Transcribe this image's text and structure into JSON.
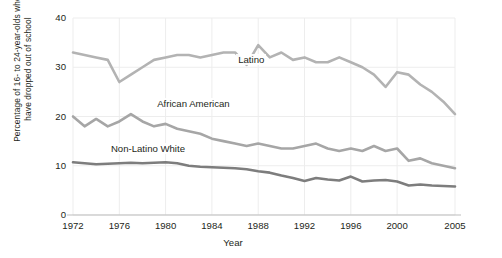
{
  "chart_data": {
    "type": "line",
    "title": "",
    "xlabel": "Year",
    "ylabel": "Percentage of 16- to 24-year-olds who have dropped out of school",
    "ylabel_lines": [
      "Percentage of 16- to 24-year-olds who",
      "have dropped out of school"
    ],
    "xlim": [
      1972,
      2005
    ],
    "ylim": [
      0,
      40
    ],
    "yticks": [
      0,
      10,
      20,
      30,
      40
    ],
    "ytick_labels": [
      "0",
      "10",
      "20",
      "30",
      "40"
    ],
    "xticks": [
      1972,
      1976,
      1980,
      1984,
      1988,
      1992,
      1996,
      2000,
      2005
    ],
    "xtick_labels": [
      "1972",
      "1976",
      "1980",
      "1984",
      "1988",
      "1992",
      "1996",
      "2000",
      "2005"
    ],
    "grid": "faint",
    "legend": "inline-labels",
    "x": [
      1972,
      1973,
      1974,
      1975,
      1976,
      1977,
      1978,
      1979,
      1980,
      1981,
      1982,
      1983,
      1984,
      1985,
      1986,
      1987,
      1988,
      1989,
      1990,
      1991,
      1992,
      1993,
      1994,
      1995,
      1996,
      1997,
      1998,
      1999,
      2000,
      2001,
      2002,
      2003,
      2004,
      2005
    ],
    "series": [
      {
        "name": "Latino",
        "color": "#b3b3b3",
        "label_x": 1988,
        "label_y": 31.5,
        "values": [
          33.0,
          32.5,
          32.0,
          31.5,
          27.0,
          28.5,
          30.0,
          31.5,
          32.0,
          32.5,
          32.5,
          32.0,
          32.5,
          33.0,
          33.0,
          30.5,
          34.5,
          32.0,
          33.0,
          31.5,
          32.0,
          31.0,
          31.0,
          32.0,
          31.0,
          30.0,
          28.5,
          26.0,
          29.0,
          28.5,
          26.5,
          25.0,
          23.0,
          20.5
        ]
      },
      {
        "name": "African American",
        "color": "#a6a6a6",
        "label_x": 1981,
        "label_y": 22.5,
        "values": [
          20.0,
          18.0,
          19.5,
          18.0,
          19.0,
          20.5,
          19.0,
          18.0,
          18.5,
          17.5,
          17.0,
          16.5,
          15.5,
          15.0,
          14.5,
          14.0,
          14.5,
          14.0,
          13.5,
          13.5,
          14.0,
          14.5,
          13.5,
          13.0,
          13.5,
          13.0,
          14.0,
          13.0,
          13.5,
          11.0,
          11.5,
          10.5,
          10.0,
          9.5
        ]
      },
      {
        "name": "Non-Latino White",
        "color": "#7d7d7d",
        "label_x": 1977,
        "label_y": 13.3,
        "values": [
          10.7,
          10.5,
          10.3,
          10.4,
          10.5,
          10.6,
          10.5,
          10.6,
          10.7,
          10.5,
          10.0,
          9.8,
          9.7,
          9.6,
          9.5,
          9.3,
          8.9,
          8.6,
          8.0,
          7.5,
          6.9,
          7.5,
          7.2,
          7.0,
          7.8,
          6.8,
          7.0,
          7.1,
          6.8,
          6.0,
          6.2,
          6.0,
          5.9,
          5.8
        ]
      }
    ]
  }
}
